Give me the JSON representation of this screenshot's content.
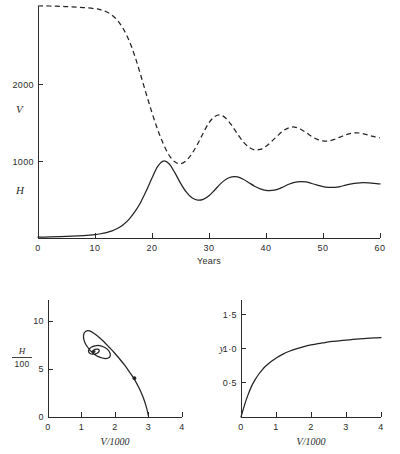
{
  "figure": {
    "panels": [
      "timeseries",
      "phase-plane",
      "functional-response"
    ]
  },
  "chart_data": [
    {
      "id": "timeseries",
      "type": "line",
      "title": "",
      "xlabel": "Years",
      "ylabel": "",
      "xlim": [
        0,
        60
      ],
      "ylim": [
        0,
        3000
      ],
      "xticks": [
        0,
        10,
        20,
        30,
        40,
        50,
        60
      ],
      "xticklabels": [
        "0",
        "10",
        "20",
        "30",
        "40",
        "50",
        "60"
      ],
      "yticks": [
        1000,
        2000
      ],
      "yticklabels": [
        "1000",
        "2000"
      ],
      "grid": false,
      "legend_position": "inline-left",
      "series": [
        {
          "name": "V",
          "label": "V",
          "style": "dashed",
          "x": [
            0,
            2,
            4,
            6,
            8,
            10,
            11,
            12,
            13,
            14,
            15,
            16,
            17,
            18,
            19,
            20,
            21,
            22,
            23,
            24,
            25,
            26,
            27,
            28,
            29,
            30,
            31,
            32,
            33,
            34,
            35,
            36,
            37,
            38,
            39,
            40,
            41,
            42,
            43,
            44,
            45,
            46,
            47,
            48,
            49,
            50,
            51,
            52,
            53,
            54,
            55,
            56,
            57,
            58,
            59,
            60
          ],
          "values": [
            3000,
            3000,
            2995,
            2990,
            2980,
            2965,
            2950,
            2925,
            2880,
            2810,
            2700,
            2550,
            2350,
            2110,
            1860,
            1620,
            1400,
            1215,
            1070,
            985,
            960,
            1000,
            1090,
            1215,
            1360,
            1490,
            1570,
            1590,
            1545,
            1455,
            1345,
            1245,
            1175,
            1140,
            1145,
            1185,
            1250,
            1320,
            1385,
            1425,
            1435,
            1410,
            1365,
            1315,
            1275,
            1255,
            1255,
            1275,
            1305,
            1335,
            1355,
            1360,
            1350,
            1330,
            1310,
            1295
          ]
        },
        {
          "name": "H",
          "label": "H",
          "style": "solid",
          "x": [
            0,
            2,
            4,
            6,
            8,
            10,
            11,
            12,
            13,
            14,
            15,
            16,
            17,
            18,
            19,
            20,
            21,
            22,
            23,
            24,
            25,
            26,
            27,
            28,
            29,
            30,
            31,
            32,
            33,
            34,
            35,
            36,
            37,
            38,
            39,
            40,
            41,
            42,
            43,
            44,
            45,
            46,
            47,
            48,
            49,
            50,
            51,
            52,
            53,
            54,
            55,
            56,
            57,
            58,
            59,
            60
          ],
          "values": [
            10,
            13,
            17,
            23,
            32,
            45,
            55,
            70,
            92,
            125,
            175,
            245,
            340,
            460,
            610,
            775,
            925,
            995,
            960,
            845,
            710,
            595,
            520,
            490,
            500,
            545,
            620,
            700,
            760,
            790,
            790,
            760,
            715,
            670,
            635,
            615,
            615,
            630,
            660,
            695,
            720,
            730,
            725,
            705,
            685,
            665,
            655,
            655,
            665,
            685,
            700,
            710,
            715,
            712,
            705,
            700
          ]
        }
      ]
    },
    {
      "id": "phase-plane",
      "type": "line",
      "title": "",
      "xlabel": "V/1000",
      "ylabel": "H/100",
      "ylabel_numerator": "H",
      "ylabel_denominator": "100",
      "xlim": [
        0,
        4
      ],
      "ylim": [
        0,
        12.2
      ],
      "xticks": [
        0,
        1,
        2,
        3,
        4
      ],
      "xticklabels": [
        "0",
        "1",
        "2",
        "3",
        "4"
      ],
      "yticks": [
        0,
        5,
        10
      ],
      "yticklabels": [
        "0",
        "5",
        "10"
      ],
      "grid": false,
      "marker": {
        "x": 2.58,
        "y": 4.05,
        "shape": "dot"
      },
      "focus": {
        "x": 1.36,
        "y": 6.75
      },
      "series": [
        {
          "name": "trajectory",
          "style": "solid",
          "x": [
            3.0,
            2.93,
            2.84,
            2.73,
            2.6,
            2.45,
            2.3,
            2.14,
            1.98,
            1.82,
            1.67,
            1.53,
            1.4,
            1.29,
            1.2,
            1.13,
            1.08,
            1.06,
            1.07,
            1.11,
            1.18,
            1.27,
            1.38,
            1.5,
            1.62,
            1.72,
            1.8,
            1.85,
            1.86,
            1.84,
            1.79,
            1.72,
            1.63,
            1.54,
            1.45,
            1.37,
            1.3,
            1.25,
            1.22,
            1.21,
            1.23,
            1.27,
            1.32,
            1.38,
            1.44,
            1.49,
            1.52,
            1.53,
            1.52,
            1.49,
            1.45,
            1.41,
            1.37,
            1.34,
            1.32,
            1.32,
            1.33,
            1.35,
            1.37,
            1.39,
            1.4,
            1.4,
            1.39,
            1.38,
            1.37,
            1.36,
            1.36
          ],
          "y": [
            0.1,
            1.1,
            2.05,
            2.95,
            3.8,
            4.6,
            5.35,
            6.05,
            6.7,
            7.3,
            7.85,
            8.3,
            8.65,
            8.9,
            9.0,
            8.95,
            8.75,
            8.45,
            8.1,
            7.7,
            7.3,
            6.9,
            6.55,
            6.3,
            6.15,
            6.1,
            6.15,
            6.3,
            6.5,
            6.75,
            7.0,
            7.2,
            7.35,
            7.45,
            7.45,
            7.4,
            7.3,
            7.15,
            7.0,
            6.85,
            6.7,
            6.6,
            6.55,
            6.55,
            6.6,
            6.7,
            6.82,
            6.94,
            7.02,
            7.07,
            7.08,
            7.05,
            6.99,
            6.92,
            6.85,
            6.79,
            6.75,
            6.73,
            6.74,
            6.77,
            6.81,
            6.85,
            6.87,
            6.87,
            6.85,
            6.82,
            6.78
          ]
        }
      ]
    },
    {
      "id": "functional-response",
      "type": "line",
      "title": "",
      "xlabel": "V/1000",
      "ylabel": "y",
      "xlim": [
        0,
        4
      ],
      "ylim": [
        0,
        1.72
      ],
      "xticks": [
        0,
        1,
        2,
        3,
        4
      ],
      "xticklabels": [
        "0",
        "1",
        "2",
        "3",
        "4"
      ],
      "yticks": [
        0.5,
        1.0,
        1.5
      ],
      "yticklabels": [
        "0·5",
        "1·0",
        "1·5"
      ],
      "grid": false,
      "series": [
        {
          "name": "y",
          "style": "solid",
          "x": [
            0,
            0.1,
            0.2,
            0.3,
            0.4,
            0.5,
            0.6,
            0.7,
            0.8,
            0.9,
            1.0,
            1.2,
            1.4,
            1.6,
            1.8,
            2.0,
            2.2,
            2.4,
            2.6,
            2.8,
            3.0,
            3.2,
            3.4,
            3.6,
            3.8,
            4.0
          ],
          "values": [
            0,
            0.175,
            0.325,
            0.45,
            0.545,
            0.625,
            0.69,
            0.745,
            0.79,
            0.83,
            0.865,
            0.925,
            0.97,
            1.005,
            1.035,
            1.06,
            1.08,
            1.095,
            1.11,
            1.12,
            1.13,
            1.14,
            1.148,
            1.155,
            1.162,
            1.168
          ]
        }
      ]
    }
  ]
}
